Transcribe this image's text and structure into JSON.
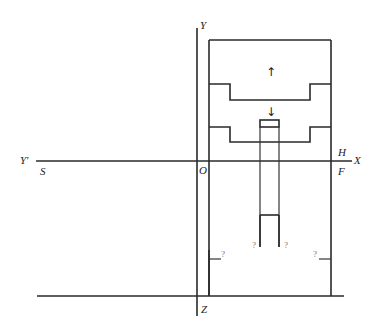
{
  "diagram": {
    "axis_labels": {
      "Y": "Y",
      "Y_prime": "Y'",
      "X": "X",
      "Z": "Z",
      "O": "O",
      "H": "H",
      "S": "S",
      "F": "F"
    },
    "unknown_marks": [
      "?",
      "?",
      "?",
      "?"
    ],
    "arrows": {
      "up": "↑",
      "down": "↓"
    },
    "colors": {
      "line": "#2a2a2a",
      "background": "#ffffff"
    }
  }
}
